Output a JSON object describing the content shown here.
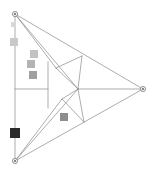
{
  "figure": {
    "width": 155,
    "height": 174,
    "background_color": "#ffffff"
  },
  "style": {
    "line_color": "#8a8a8a",
    "line_color_light": "#a8a8a8",
    "line_width": 0.7,
    "vertex_stroke": "#6f6f6f",
    "vertex_fill": "#f2f2f2",
    "vertex_radius": 2.6,
    "vertex_inner_radius": 0.9,
    "vertex_inner_fill": "#555555"
  },
  "vertices": [
    {
      "name": "top-vertex",
      "x": 15,
      "y": 14
    },
    {
      "name": "right-vertex",
      "x": 143,
      "y": 89
    },
    {
      "name": "bottom-vertex",
      "x": 15,
      "y": 161
    }
  ],
  "nodes": [
    {
      "name": "upper-edge-node",
      "x": 82,
      "y": 56
    },
    {
      "name": "center-node",
      "x": 78,
      "y": 89
    },
    {
      "name": "inner-upper-node",
      "x": 56,
      "y": 68
    },
    {
      "name": "inner-lower-node",
      "x": 62,
      "y": 99
    },
    {
      "name": "lower-edge-node",
      "x": 84,
      "y": 122
    },
    {
      "name": "left-spine-top",
      "x": 15,
      "y": 14
    },
    {
      "name": "left-spine-mid",
      "x": 15,
      "y": 89
    },
    {
      "name": "left-spine-bottom",
      "x": 15,
      "y": 161
    },
    {
      "name": "crossbar-right",
      "x": 48,
      "y": 89
    },
    {
      "name": "crossbar-vertical-top",
      "x": 48,
      "y": 62
    },
    {
      "name": "crossbar-vertical-bottom",
      "x": 48,
      "y": 108
    }
  ],
  "edges": [
    {
      "name": "outer-edge-top-right",
      "from": [
        15,
        14
      ],
      "to": [
        143,
        89
      ]
    },
    {
      "name": "outer-edge-right-bottom",
      "from": [
        143,
        89
      ],
      "to": [
        15,
        161
      ]
    },
    {
      "name": "outer-edge-left-spine",
      "from": [
        15,
        14
      ],
      "to": [
        15,
        161
      ]
    },
    {
      "name": "chord-top-to-center",
      "from": [
        15,
        14
      ],
      "to": [
        78,
        89
      ]
    },
    {
      "name": "chord-top-to-inner-upper",
      "from": [
        15,
        14
      ],
      "to": [
        56,
        68
      ]
    },
    {
      "name": "chord-bottom-to-center",
      "from": [
        15,
        161
      ],
      "to": [
        78,
        89
      ]
    },
    {
      "name": "chord-bottom-to-inner-lower",
      "from": [
        15,
        161
      ],
      "to": [
        62,
        99
      ]
    },
    {
      "name": "spoke-center-to-right",
      "from": [
        78,
        89
      ],
      "to": [
        143,
        89
      ]
    },
    {
      "name": "spoke-center-to-inner-upper",
      "from": [
        78,
        89
      ],
      "to": [
        56,
        68
      ]
    },
    {
      "name": "spoke-center-to-inner-lower",
      "from": [
        78,
        89
      ],
      "to": [
        62,
        99
      ]
    },
    {
      "name": "rib-upper-node-to-inner-upper",
      "from": [
        82,
        56
      ],
      "to": [
        56,
        68
      ]
    },
    {
      "name": "rib-upper-node-to-center",
      "from": [
        82,
        56
      ],
      "to": [
        78,
        89
      ]
    },
    {
      "name": "rib-lower-node-to-inner-lower",
      "from": [
        84,
        122
      ],
      "to": [
        62,
        99
      ]
    },
    {
      "name": "rib-lower-node-to-center",
      "from": [
        84,
        122
      ],
      "to": [
        78,
        89
      ]
    },
    {
      "name": "crossbar-horizontal",
      "from": [
        15,
        89
      ],
      "to": [
        48,
        89
      ]
    },
    {
      "name": "crossbar-vertical",
      "from": [
        48,
        62
      ],
      "to": [
        48,
        108
      ]
    }
  ],
  "markers": [
    {
      "name": "marker-light-upper",
      "x": 11,
      "y": 22,
      "size": 5,
      "color": "#d8d8d8"
    },
    {
      "name": "marker-light-spine",
      "x": 10,
      "y": 38,
      "size": 8,
      "color": "#c9c9c9"
    },
    {
      "name": "marker-gray-1",
      "x": 30,
      "y": 50,
      "size": 8,
      "color": "#c2c2c2"
    },
    {
      "name": "marker-gray-2",
      "x": 27,
      "y": 60,
      "size": 8,
      "color": "#b3b3b3"
    },
    {
      "name": "marker-gray-3",
      "x": 29,
      "y": 71,
      "size": 8,
      "color": "#a0a0a0"
    },
    {
      "name": "marker-gray-mid",
      "x": 60,
      "y": 113,
      "size": 8,
      "color": "#8d8d8d"
    },
    {
      "name": "marker-dark-bottom",
      "x": 10,
      "y": 128,
      "size": 10,
      "color": "#2b2b2b"
    }
  ]
}
